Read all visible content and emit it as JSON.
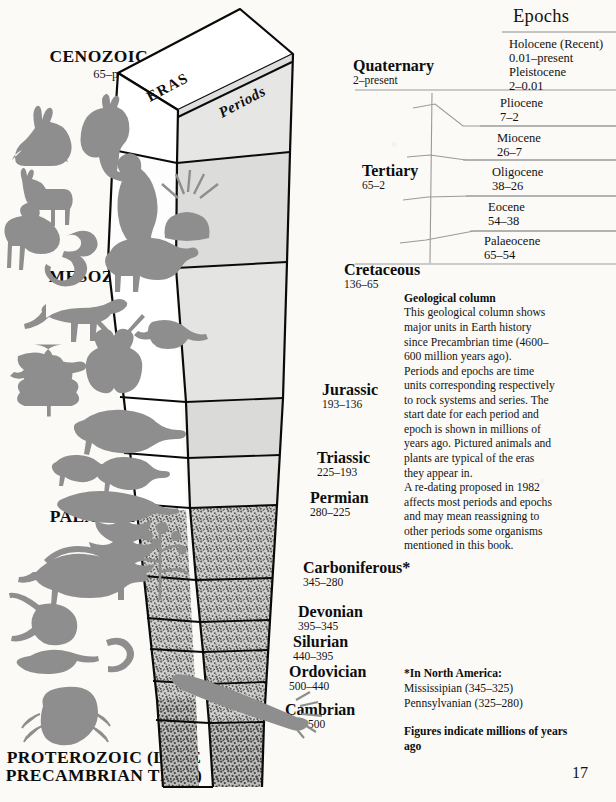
{
  "page": {
    "page_number": "17",
    "column_face_labels": {
      "left": "ERAS",
      "right": "Periods"
    }
  },
  "eras": [
    {
      "name": "CENOZOIC",
      "range": "65–present"
    },
    {
      "name": "MESOZOIC",
      "range": "225–65"
    },
    {
      "name": "PALAEOZOIC",
      "range": "600–225"
    },
    {
      "name": "PROTEROZOIC (LATE PRECAMBRIAN TIME)",
      "range": ""
    }
  ],
  "periods": [
    {
      "name": "Quaternary",
      "range": "2–present"
    },
    {
      "name": "Tertiary",
      "range": "65–2"
    },
    {
      "name": "Cretaceous",
      "range": "136–65"
    },
    {
      "name": "Jurassic",
      "range": "193–136"
    },
    {
      "name": "Triassic",
      "range": "225–193"
    },
    {
      "name": "Permian",
      "range": "280–225"
    },
    {
      "name": "Carboniferous*",
      "range": "345–280"
    },
    {
      "name": "Devonian",
      "range": "395–345"
    },
    {
      "name": "Silurian",
      "range": "440–395"
    },
    {
      "name": "Ordovician",
      "range": "500–440"
    },
    {
      "name": "Cambrian",
      "range": "600–500"
    }
  ],
  "epochs_panel": {
    "title": "Epochs",
    "items": [
      {
        "name": "Holocene (Recent)",
        "range": "0.01–present"
      },
      {
        "name": "Pleistocene",
        "range": "2–0.01"
      },
      {
        "name": "Pliocene",
        "range": "7–2"
      },
      {
        "name": "Miocene",
        "range": "26–7"
      },
      {
        "name": "Oligocene",
        "range": "38–26"
      },
      {
        "name": "Eocene",
        "range": "54–38"
      },
      {
        "name": "Palaeocene",
        "range": "65–54"
      }
    ]
  },
  "geological_note": {
    "title": "Geological column",
    "paragraphs": [
      "This geological column shows major units in Earth history since Precambrian time (4600–600 million years ago).",
      "Periods and epochs are time units corresponding respectively to rock systems and series. The start date for each period and epoch is shown in millions of years ago. Pictured animals and plants are typical of the eras they appear in.",
      "A re-dating proposed in 1982 affects most periods and epochs and may mean reassigning to other periods some organisms mentioned in this book."
    ]
  },
  "footnote": {
    "title": "*In North America:",
    "lines": [
      "Mississipian (345–325)",
      "Pennsylvanian (325–280)"
    ],
    "figures_note": "Figures indicate millions of years ago"
  },
  "colors": {
    "ink": "#111111",
    "outline": "#0a0a0a",
    "face_light": "#ffffff",
    "face_shade": "#e3e3e1",
    "face_shade_dark": "#d6d6d4",
    "stipple": "#7a7a78",
    "fauna": "#8b8b8b",
    "rule": "#8e8e8e",
    "paper": "#fbfaf7"
  }
}
